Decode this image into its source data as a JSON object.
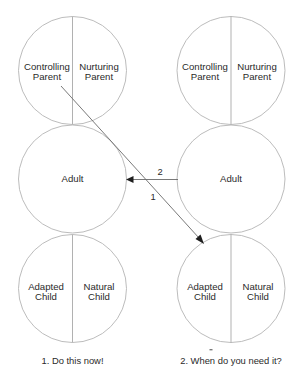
{
  "diagram": {
    "type": "ego-state transactional analysis diagram",
    "left": {
      "parent": {
        "left_label_1": "Controlling",
        "left_label_2": "Parent",
        "right_label_1": "Nurturing",
        "right_label_2": "Parent"
      },
      "adult": {
        "label": "Adult"
      },
      "child": {
        "left_label_1": "Adapted",
        "left_label_2": "Child",
        "right_label_1": "Natural",
        "right_label_2": "Child"
      },
      "caption": "1. Do this now!"
    },
    "right": {
      "parent": {
        "left_label_1": "Controlling",
        "left_label_2": "Parent",
        "right_label_1": "Nurturing",
        "right_label_2": "Parent"
      },
      "adult": {
        "label": "Adult"
      },
      "child": {
        "left_label_1": "Adapted",
        "left_label_2": "Child",
        "right_label_1": "Natural",
        "right_label_2": "Child"
      },
      "caption": "2. When do you need it?"
    },
    "arrows": [
      {
        "id": "1",
        "label": "1",
        "from": "left Controlling Parent",
        "to": "right Adapted Child"
      },
      {
        "id": "2",
        "label": "2",
        "from": "right Adult",
        "to": "left Adult"
      }
    ],
    "colors": {
      "circle_stroke": "#b4b4b4",
      "text": "#2a2a2a",
      "arrow": "#6a6a6a"
    }
  }
}
